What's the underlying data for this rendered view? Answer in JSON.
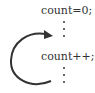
{
  "diagram": {
    "statements": [
      {
        "text": "count=0;"
      },
      {
        "text": "count++;"
      }
    ],
    "ellipsis_glyph": "vertical-dots",
    "arrow": {
      "type": "loop-back",
      "from": "below count++",
      "to": "above count++",
      "color": "#333333"
    }
  }
}
